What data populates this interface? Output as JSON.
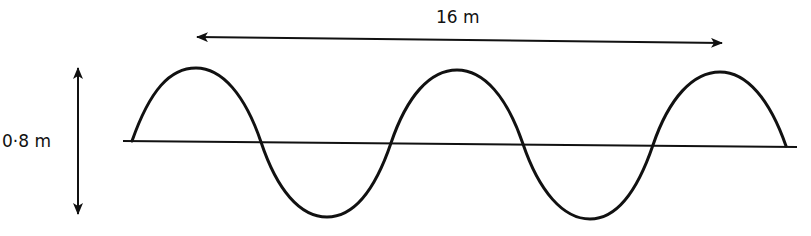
{
  "diagram": {
    "type": "transverse-wave",
    "wavelength_arrow_label": "16 m",
    "height_arrow_label": "0·8 m",
    "colors": {
      "stroke": "#111111",
      "background": "#ffffff"
    },
    "wave": {
      "start_x": 132,
      "end_x": 786,
      "peaks": [
        [
          196,
          68
        ],
        [
          457,
          70
        ],
        [
          720,
          72
        ]
      ],
      "troughs": [
        [
          327,
          217
        ],
        [
          590,
          219
        ]
      ],
      "zero_crossings_x": [
        132,
        261,
        391,
        523,
        653,
        786
      ]
    },
    "baseline": {
      "x1": 123,
      "y1": 141,
      "x2": 797,
      "y2": 147
    },
    "horizontal_arrow": {
      "x1": 197,
      "y1": 37,
      "x2": 722,
      "y2": 43
    },
    "vertical_arrow": {
      "x": 78,
      "y1": 68,
      "y2": 214
    }
  }
}
